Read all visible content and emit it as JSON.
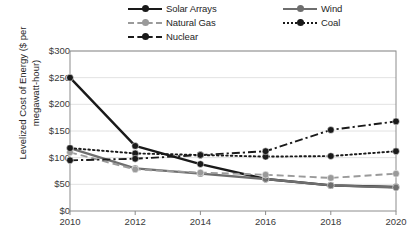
{
  "chart_data": {
    "type": "line",
    "title": "",
    "xlabel": "",
    "ylabel": "Levelized Cost of Energy ($ per megawatt-hour)",
    "ylabel_line1": "Levelized Cost of Energy ($ per",
    "ylabel_line2": "megawatt-hour)",
    "x": [
      2010,
      2012,
      2014,
      2016,
      2018,
      2020
    ],
    "xtick_labels": [
      "2010",
      "2012",
      "2014",
      "2016",
      "2018",
      "2020"
    ],
    "ytick_labels": [
      "$300",
      "$250",
      "$200",
      "$150",
      "$100",
      "$50",
      "$0"
    ],
    "ytick_values": [
      300,
      250,
      200,
      150,
      100,
      50,
      0
    ],
    "xlim": [
      2010,
      2020
    ],
    "ylim": [
      0,
      300
    ],
    "grid": "horizontal",
    "legend_position": "top-center",
    "series": [
      {
        "name": "Solar Arrays",
        "values": [
          250,
          122,
          88,
          60,
          48,
          45
        ],
        "color": "#1a1a1a",
        "marker_color": "#1a1a1a",
        "line_style": "solid",
        "legend_key": "solid-dark"
      },
      {
        "name": "Wind",
        "values": [
          118,
          80,
          70,
          60,
          48,
          44
        ],
        "color": "#6e6e6e",
        "marker_color": "#6e6e6e",
        "line_style": "solid",
        "legend_key": "solid-gray"
      },
      {
        "name": "Natural Gas",
        "values": [
          110,
          78,
          72,
          68,
          62,
          70
        ],
        "color": "#9a9a9a",
        "marker_color": "#9a9a9a",
        "line_style": "dashed",
        "legend_key": "dash-gray"
      },
      {
        "name": "Coal",
        "values": [
          118,
          108,
          105,
          102,
          103,
          112
        ],
        "color": "#1a1a1a",
        "marker_color": "#1a1a1a",
        "line_style": "dotted",
        "legend_key": "dot-dark"
      },
      {
        "name": "Nuclear",
        "values": [
          95,
          98,
          105,
          112,
          152,
          168
        ],
        "color": "#1a1a1a",
        "marker_color": "#1a1a1a",
        "line_style": "dashdot",
        "legend_key": "dashdot-dark"
      }
    ]
  },
  "legend": {
    "entries": [
      {
        "label": "Solar Arrays"
      },
      {
        "label": "Wind"
      },
      {
        "label": "Natural Gas"
      },
      {
        "label": "Coal"
      },
      {
        "label": "Nuclear"
      }
    ]
  },
  "colors": {
    "solar": "#1a1a1a",
    "wind": "#6e6e6e",
    "natural_gas": "#9a9a9a",
    "coal": "#1a1a1a",
    "nuclear": "#1a1a1a",
    "plot_border": "#8c8c8c",
    "gridline": "#e2e2e2",
    "background": "#ffffff"
  }
}
